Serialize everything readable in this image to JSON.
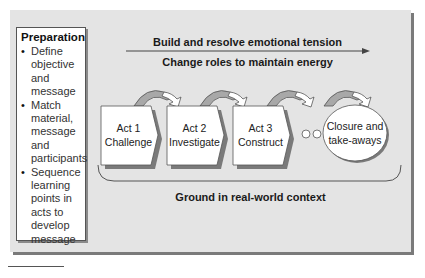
{
  "preparation": {
    "title": "Preparation",
    "items": [
      [
        "Define",
        "objective",
        "and",
        "message"
      ],
      [
        "Match",
        "material,",
        "message",
        "and",
        "participants"
      ],
      [
        "Sequence",
        "learning",
        "points in",
        "acts to",
        "develop",
        "message"
      ]
    ]
  },
  "flow": {
    "top_label": "Build and resolve emotional tension",
    "middle_label": "Change roles to maintain energy",
    "bottom_label": "Ground in real-world context"
  },
  "acts": [
    {
      "line1": "Act 1",
      "line2": "Challenge"
    },
    {
      "line1": "Act 2",
      "line2": "Investigate"
    },
    {
      "line1": "Act 3",
      "line2": "Construct"
    }
  ],
  "closure": {
    "line1": "Closure and",
    "line2": "take-aways"
  },
  "colors": {
    "panel_bg": "#e4e4e4",
    "panel_shadow": "#7a7a7a",
    "box_fill": "#ffffff",
    "stroke": "#555555",
    "arrow_fill": "#9a9a9a"
  }
}
